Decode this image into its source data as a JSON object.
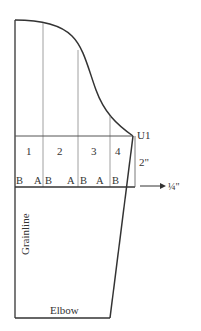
{
  "diagram": {
    "section_labels": [
      "1",
      "2",
      "3",
      "4"
    ],
    "band_labels": [
      "B",
      "A",
      "B",
      "A",
      "B",
      "A",
      "B"
    ],
    "point_label": "U1",
    "measure_vertical": "2\"",
    "measure_arrow": "¼\"",
    "grainline_label": "Grainline",
    "bottom_label": "Elbow",
    "colors": {
      "outline": "#333333",
      "guide": "#888888",
      "text": "#333333"
    }
  }
}
